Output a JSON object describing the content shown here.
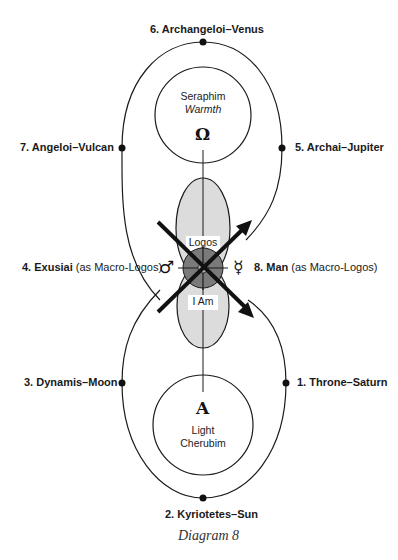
{
  "diagram": {
    "caption": "Diagram 8",
    "upper_circle": {
      "name": "Seraphim",
      "quality": "Warmth",
      "symbol": "Ω"
    },
    "lower_circle": {
      "name": "Cherubim",
      "quality": "Light",
      "symbol": "A"
    },
    "upper_oval": "Logos",
    "lower_oval": "I Am",
    "left_symbol": "♂",
    "right_symbol": "☿",
    "labels": [
      {
        "num": "1.",
        "text": "Throne–Saturn",
        "paren": ""
      },
      {
        "num": "2.",
        "text": "Kyriotetes–Sun",
        "paren": ""
      },
      {
        "num": "3.",
        "text": "Dynamis–Moon",
        "paren": ""
      },
      {
        "num": "4.",
        "text": "Exusiai",
        "paren": "(as Macro-Logos)"
      },
      {
        "num": "5.",
        "text": "Archai–Jupiter",
        "paren": ""
      },
      {
        "num": "6.",
        "text": "Archangeloi–Venus",
        "paren": ""
      },
      {
        "num": "7.",
        "text": "Angeloi–Vulcan",
        "paren": ""
      },
      {
        "num": "8.",
        "text": "Man",
        "paren": "(as Macro-Logos)"
      }
    ],
    "colors": {
      "line": "#1a1a1a",
      "oval_fill": "#dcdcdc",
      "center_disk": "#7a7a7a",
      "center_dot": "#b0b0b0"
    }
  }
}
